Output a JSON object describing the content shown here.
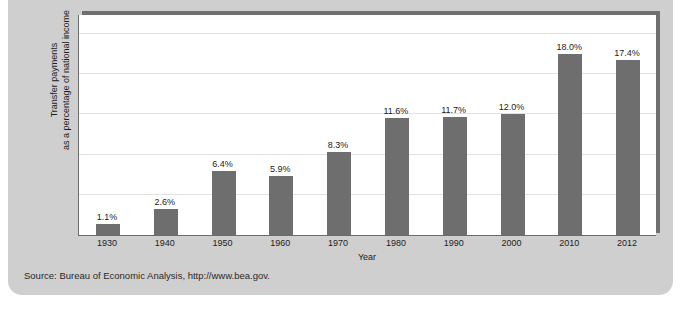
{
  "figure": {
    "clipped_heading": "",
    "source_note": "Source: Bureau of Economic Analysis, http://www.bea.gov.",
    "colors": {
      "bar": "#6e6e6e",
      "panel": "#cfcfcf",
      "plot_background": "#ffffff",
      "gridline": "#e2e2e2",
      "axis": "#6b6b6b",
      "text": "#1c1c1c"
    }
  },
  "chart_data": {
    "type": "bar",
    "title": "",
    "xlabel": "Year",
    "ylabel": "Transfer payments as a percentage of national income",
    "ylabel_line1": "Transfer payments",
    "ylabel_line2": "as a percentage of national income",
    "categories": [
      "1930",
      "1940",
      "1950",
      "1960",
      "1970",
      "1980",
      "1990",
      "2000",
      "2010",
      "2012"
    ],
    "values": [
      1.1,
      2.6,
      6.4,
      5.9,
      8.3,
      11.6,
      11.7,
      12.0,
      18.0,
      17.4
    ],
    "data_labels": [
      "1.1%",
      "2.6%",
      "6.4%",
      "5.9%",
      "8.3%",
      "11.6%",
      "11.7%",
      "12.0%",
      "18.0%",
      "17.4%"
    ],
    "ylim": [
      0,
      22
    ],
    "grid": true,
    "gridline_values": [
      4,
      8,
      12,
      16,
      20
    ],
    "legend": null,
    "tick_labels_x": [
      "1930",
      "1940",
      "1950",
      "1960",
      "1970",
      "1980",
      "1990",
      "2000",
      "2010",
      "2012"
    ],
    "tick_labels_y": []
  }
}
